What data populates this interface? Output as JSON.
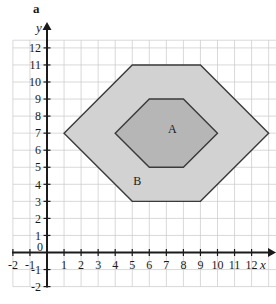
{
  "part_label": "a",
  "axes": {
    "x_name": "x",
    "y_name": "y",
    "origin_label": "0",
    "x_tick_labels": [
      "-2",
      "-1",
      "1",
      "2",
      "3",
      "4",
      "5",
      "6",
      "7",
      "8",
      "9",
      "10",
      "11",
      "12"
    ],
    "y_tick_labels": [
      "-2",
      "-1",
      "1",
      "2",
      "3",
      "4",
      "5",
      "6",
      "7",
      "8",
      "9",
      "10",
      "11",
      "12"
    ],
    "x_min": -2,
    "x_max": 13,
    "y_min": -2,
    "y_max": 12.5,
    "grid": true,
    "grid_color": "#c9c9c9",
    "axis_color": "#1a1a1a"
  },
  "chart_data": {
    "type": "scatter",
    "title": "",
    "xlabel": "x",
    "ylabel": "y",
    "xlim": [
      -2,
      13
    ],
    "ylim": [
      -2,
      12
    ],
    "grid": true,
    "shapes": [
      {
        "label": "B",
        "kind": "hexagon",
        "vertices": [
          [
            1,
            7
          ],
          [
            5,
            11
          ],
          [
            9,
            11
          ],
          [
            13,
            7
          ],
          [
            9,
            3
          ],
          [
            5,
            3
          ]
        ],
        "fill": "#d2d2d2",
        "stroke": "#3a3a3a",
        "label_position": [
          5.3,
          4.2
        ]
      },
      {
        "label": "A",
        "kind": "hexagon",
        "vertices": [
          [
            4,
            7
          ],
          [
            6,
            9
          ],
          [
            8,
            9
          ],
          [
            10,
            7
          ],
          [
            8,
            5
          ],
          [
            6,
            5
          ]
        ],
        "fill": "#b6b6b6",
        "stroke": "#3a3a3a",
        "label_position": [
          7.35,
          7.25
        ]
      }
    ]
  }
}
